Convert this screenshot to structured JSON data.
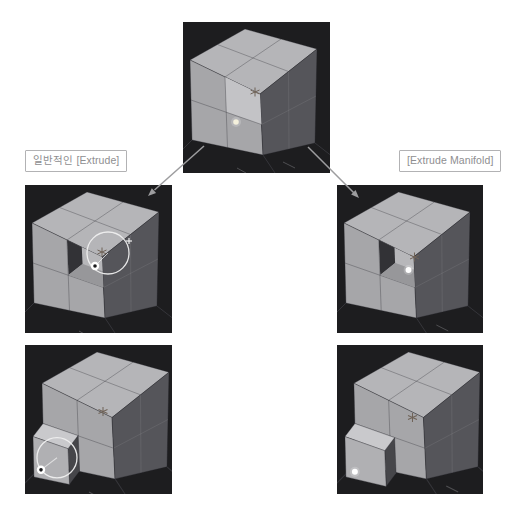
{
  "labels": {
    "left": "일반적인 [Extrude]",
    "right": "[Extrude Manifold]"
  },
  "colors": {
    "page_bg": "#ffffff",
    "viewport_bg": "#1d1d1f",
    "grid_line": "#35353a",
    "grid_tick": "#9a9a9e",
    "face_top": "#b5b5b8",
    "face_front": "#a6a6a9",
    "face_side": "#55555a",
    "face_selected": "#c3c3c6",
    "recess_wall": "#323236",
    "recess_floor": "#97979a",
    "recess_face": "#b7b7ba",
    "block_top": "#c9c9cc",
    "block_front": "#b0b0b3",
    "block_side": "#46464a",
    "gizmo": "#efefef",
    "dot": "#ffffff",
    "dot_warm": "#f4f0dc",
    "marker": "#6f6257",
    "arrow": "#9d9d9f",
    "label_border": "#b2b2b4",
    "label_text": "#8e8e90"
  }
}
